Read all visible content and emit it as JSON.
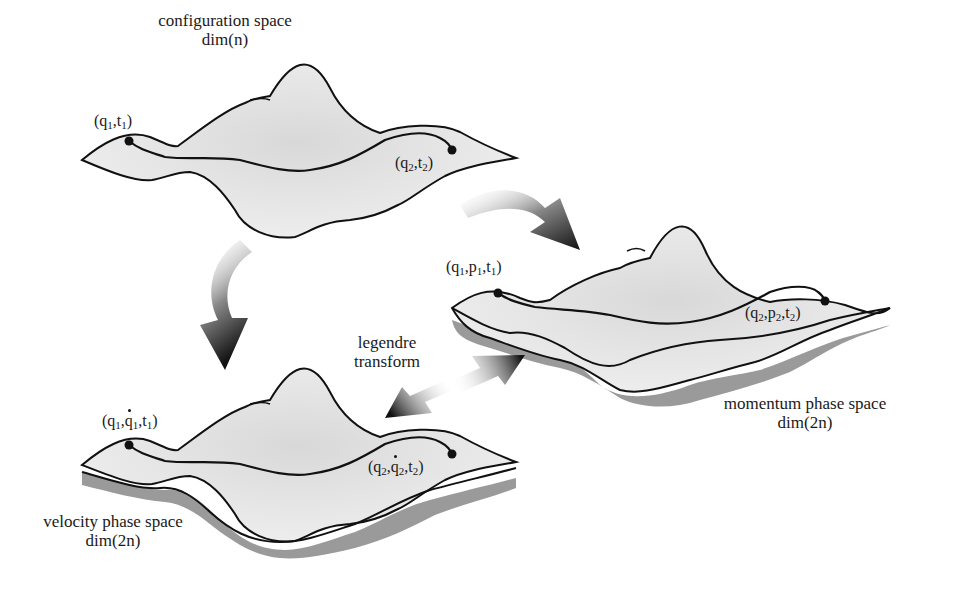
{
  "diagram": {
    "spaces": {
      "configuration": {
        "title": "configuration space",
        "dim": "dim(n)",
        "start": {
          "q": "q",
          "qi": "1",
          "t": "t",
          "ti": "1"
        },
        "end": {
          "q": "q",
          "qi": "2",
          "t": "t",
          "ti": "2"
        }
      },
      "momentum": {
        "title": "momentum phase space",
        "dim": "dim(2n)",
        "start": {
          "q": "q",
          "qi": "1",
          "p": "p",
          "pi": "1",
          "t": "t",
          "ti": "1"
        },
        "end": {
          "q": "q",
          "qi": "2",
          "p": "p",
          "pi": "2",
          "t": "t",
          "ti": "2"
        }
      },
      "velocity": {
        "title": "velocity phase space",
        "dim": "dim(2n)",
        "start": {
          "q": "q",
          "qi": "1",
          "qdot": "q",
          "qdoti": "1",
          "t": "t",
          "ti": "1"
        },
        "end": {
          "q": "q",
          "qi": "2",
          "qdot": "q",
          "qdoti": "2",
          "t": "t",
          "ti": "2"
        }
      }
    },
    "transform": {
      "line1": "legendre",
      "line2": "transform"
    },
    "colors": {
      "surface": "#e6e6e6",
      "shadow": "#9a9a9a",
      "outline": "#111111",
      "arrow_dark": "#1a1a1a",
      "background": "#ffffff"
    }
  }
}
